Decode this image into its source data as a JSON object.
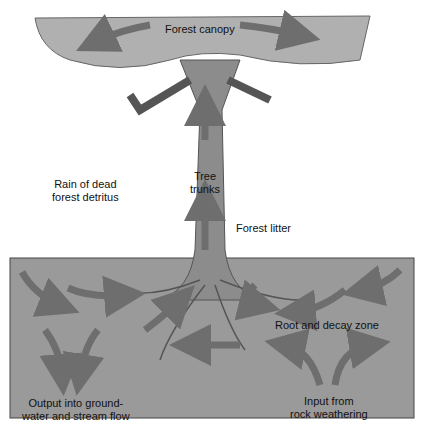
{
  "diagram": {
    "labels": {
      "canopy": "Forest canopy",
      "trunk": [
        "Tree",
        "trunks"
      ],
      "rain": [
        "Rain of dead",
        "forest detritus"
      ],
      "litter": "Forest litter",
      "root_zone": "Root and decay zone",
      "output": [
        "Output into ground-",
        "water and stream flow"
      ],
      "input": [
        "Input from",
        "rock weathering"
      ]
    },
    "colors": {
      "canopy": "#b0b0b0",
      "trunk": "#8c8c8c",
      "soil": "#9a9a9a",
      "arrow": "#6e6e6e"
    }
  }
}
